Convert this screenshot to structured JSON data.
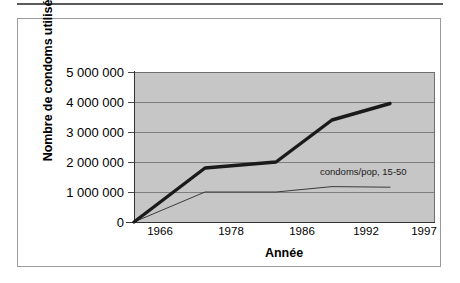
{
  "figure": {
    "name": "condom-usage-line-chart",
    "background_color": "#ffffff",
    "plot_background_color": "#c6c6c6",
    "frame_color": "#9a9a9a",
    "gridline_color": "#7d7d7d"
  },
  "chart_data": {
    "type": "line",
    "title": "",
    "xlabel": "Année",
    "ylabel": "Nombre de condoms utilisés",
    "categories": [
      "1966",
      "1978",
      "1986",
      "1992",
      "1997"
    ],
    "x": [
      1966,
      1978,
      1986,
      1992,
      1997
    ],
    "ylim": [
      0,
      5000000
    ],
    "ytick_labels": [
      "5 000 000",
      "4 000 000",
      "3 000 000",
      "2 000 000",
      "1 000 000",
      "0"
    ],
    "ytick_values": [
      5000000,
      4000000,
      3000000,
      2000000,
      1000000,
      0
    ],
    "grid": true,
    "legend_position": "in-plot-annotation",
    "series": [
      {
        "name": "Nombre de condoms utilisés",
        "label": "",
        "style": "thick",
        "color": "#1a1a1a",
        "values": [
          0,
          1800000,
          2000000,
          3400000,
          3950000
        ]
      },
      {
        "name": "condoms/pop, 15-50",
        "label": "condoms/pop, 15-50",
        "style": "thin",
        "color": "#3a3a3a",
        "values": [
          0,
          1000000,
          1000000,
          1180000,
          1160000
        ]
      }
    ],
    "annotations": [
      {
        "text": "condoms/pop, 15-50",
        "x": 1992,
        "y": 1650000
      }
    ]
  }
}
